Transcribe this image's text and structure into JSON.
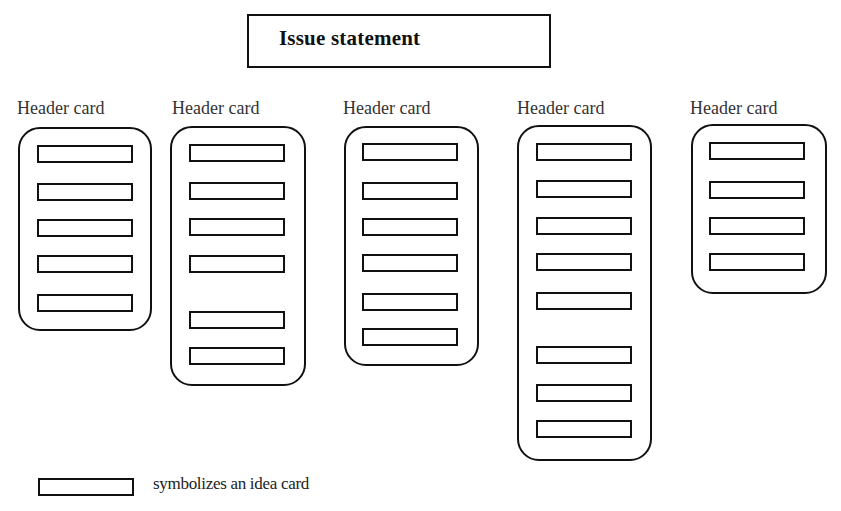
{
  "issue_statement": {
    "label": "Issue statement"
  },
  "columns": [
    {
      "header": "Header card",
      "label_x": 17,
      "label_y": 98,
      "box": {
        "x": 18,
        "y": 127,
        "w": 134,
        "h": 204
      },
      "ideas_y": [
        145,
        183,
        219,
        255,
        294
      ],
      "idea_x": 37
    },
    {
      "header": "Header card",
      "label_x": 172,
      "label_y": 98,
      "box": {
        "x": 170,
        "y": 126,
        "w": 136,
        "h": 260
      },
      "ideas_y": [
        144,
        182,
        218,
        255,
        311,
        347
      ],
      "idea_x": 189
    },
    {
      "header": "Header card",
      "label_x": 343,
      "label_y": 98,
      "box": {
        "x": 344,
        "y": 126,
        "w": 135,
        "h": 240
      },
      "ideas_y": [
        143,
        182,
        218,
        254,
        293,
        328
      ],
      "idea_x": 362
    },
    {
      "header": "Header card",
      "label_x": 517,
      "label_y": 98,
      "box": {
        "x": 517,
        "y": 125,
        "w": 135,
        "h": 336
      },
      "ideas_y": [
        143,
        180,
        217,
        253,
        292,
        346,
        384,
        420
      ],
      "idea_x": 536
    },
    {
      "header": "Header card",
      "label_x": 690,
      "label_y": 98,
      "box": {
        "x": 691,
        "y": 124,
        "w": 136,
        "h": 170
      },
      "ideas_y": [
        142,
        181,
        217,
        253
      ],
      "idea_x": 709
    }
  ],
  "legend": {
    "text": "symbolizes an idea card"
  },
  "colors": {
    "stroke": "#111111",
    "background": "#ffffff"
  }
}
